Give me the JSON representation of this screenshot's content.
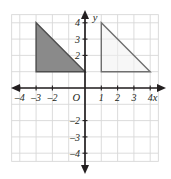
{
  "figure": {
    "origin_label": "O",
    "x_axis_name": "x",
    "y_axis_name": "y"
  },
  "chart_data": {
    "type": "scatter",
    "title": "",
    "xlabel": "x",
    "ylabel": "y",
    "xlim": [
      -4.5,
      4.5
    ],
    "ylim": [
      -4.5,
      4.5
    ],
    "grid": true,
    "grid_spacing": 1,
    "legend": "none",
    "x_ticks": [
      -4,
      -3,
      -2,
      1,
      2,
      3,
      4
    ],
    "x_tick_labels": [
      "–4",
      "–3",
      "–2",
      "1",
      "2",
      "3",
      "4"
    ],
    "y_ticks": [
      4,
      3,
      2,
      -2,
      -3,
      -4
    ],
    "y_tick_labels": [
      "4",
      "3",
      "2",
      "–2",
      "–3",
      "–4"
    ],
    "origin_label": "O",
    "axis_color": "#231f20",
    "grid_color": "#d8d8d8",
    "shapes": [
      {
        "name": "left-triangle",
        "kind": "triangle",
        "vertices": [
          [
            -3,
            4
          ],
          [
            -3,
            1
          ],
          [
            0,
            1
          ]
        ],
        "fill": "#8a8a8a",
        "stroke": "#4d4d4d",
        "stroke_width": 1.4
      },
      {
        "name": "right-triangle",
        "kind": "triangle",
        "vertices": [
          [
            1,
            4
          ],
          [
            1,
            1
          ],
          [
            4,
            1
          ]
        ],
        "fill": "#f0f0f0",
        "stroke": "#6f6f6f",
        "stroke_width": 1.4
      }
    ]
  }
}
